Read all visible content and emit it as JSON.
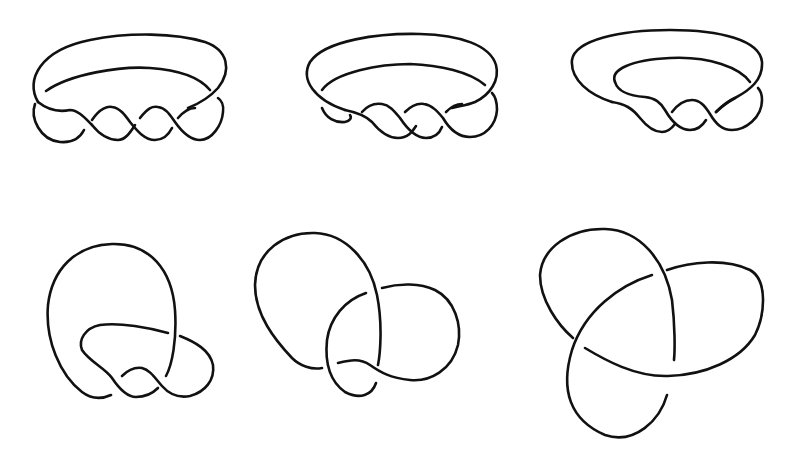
{
  "figure": {
    "stroke_color": "#111111",
    "background": "#ffffff",
    "panels": [
      {
        "id": "knot-1",
        "row": 1,
        "col": 1,
        "label": "twisted-band-three-half-twists"
      },
      {
        "id": "knot-2",
        "row": 1,
        "col": 2,
        "label": "twisted-band-deformed-left"
      },
      {
        "id": "knot-3",
        "row": 1,
        "col": 3,
        "label": "twisted-band-tucked-loop"
      },
      {
        "id": "knot-4",
        "row": 2,
        "col": 1,
        "label": "loop-stretched-vertical"
      },
      {
        "id": "knot-5",
        "row": 2,
        "col": 2,
        "label": "pretzel-intermediate"
      },
      {
        "id": "knot-6",
        "row": 2,
        "col": 3,
        "label": "trefoil-knot"
      }
    ]
  }
}
